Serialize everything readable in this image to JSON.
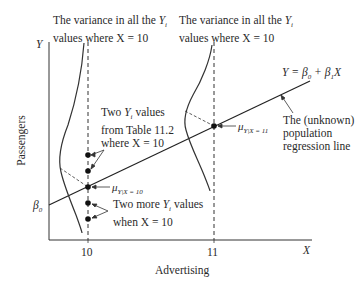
{
  "diagram": {
    "title_left": {
      "line1": "The variance in all the",
      "var": "Y",
      "sub": "i",
      "line2": "values where X = 10"
    },
    "title_right": {
      "line1": "The variance in all the",
      "var": "Y",
      "sub": "i",
      "line2": "values where X = 10"
    },
    "y_axis_label": "Passengers",
    "x_axis_label": "Advertising",
    "y_axis_symbol": "Y",
    "x_axis_symbol": "X",
    "beta0": "β",
    "beta0_sub": "0",
    "x_ticks": [
      "10",
      "11"
    ],
    "equation": "Y = β0 + β1X",
    "equation_parts": {
      "lhs": "Y = β",
      "s0": "0",
      "mid": " + β",
      "s1": "1",
      "rhs": "X"
    },
    "mu10": {
      "mu": "μ",
      "sub": "Y|X = 10"
    },
    "mu11": {
      "mu": "μ",
      "sub": "Y|X = 11"
    },
    "annot_two_table": {
      "l1a": "Two ",
      "var": "Y",
      "sub": "i",
      "l1b": " values",
      "l2": "from Table 11.2",
      "l3": "where X = 10"
    },
    "annot_two_more": {
      "l1a": "Two more ",
      "var": "Y",
      "sub": "i",
      "l1b": " values",
      "l2": "when X = 10"
    },
    "annot_population": {
      "l1": "The (unknown)",
      "l2": "population",
      "l3": "regression line"
    }
  }
}
